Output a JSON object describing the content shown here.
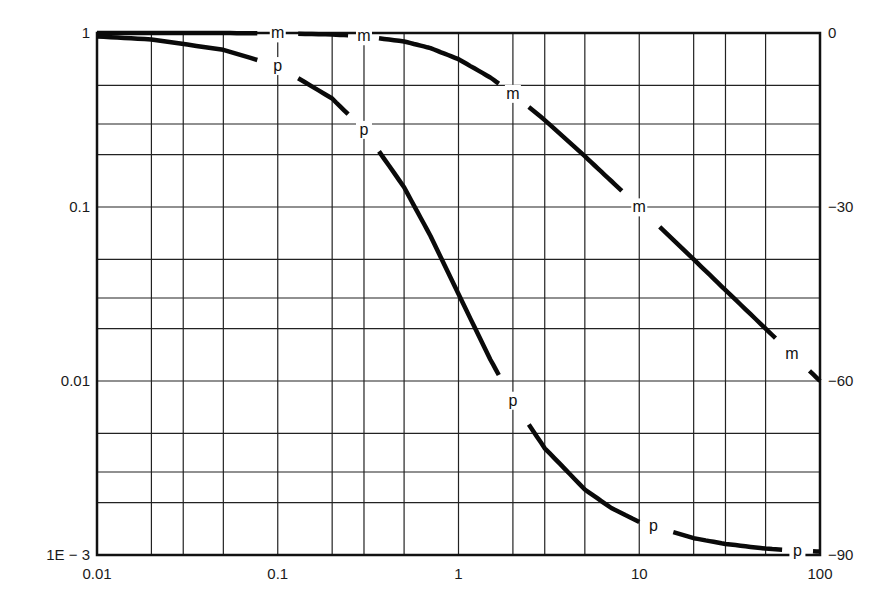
{
  "chart_data": {
    "type": "line",
    "title": "",
    "xlabel": "",
    "ylabel": "",
    "ylabel_right": "",
    "x_scale": "log",
    "y_scale": "log",
    "xlim": [
      0.01,
      100
    ],
    "ylim": [
      0.001,
      1
    ],
    "ylim_right": [
      -90,
      0
    ],
    "grid": true,
    "legend": null,
    "x_ticks": [
      {
        "value": 0.01,
        "label": "0.01"
      },
      {
        "value": 0.1,
        "label": "0.1"
      },
      {
        "value": 1,
        "label": "1"
      },
      {
        "value": 10,
        "label": "10"
      },
      {
        "value": 100,
        "label": "100"
      }
    ],
    "y_ticks_left": [
      {
        "value": 1,
        "label": "1"
      },
      {
        "value": 0.1,
        "label": "0.1"
      },
      {
        "value": 0.01,
        "label": "0.01"
      },
      {
        "value": 0.001,
        "label": "1E − 3"
      }
    ],
    "y_ticks_right": [
      {
        "value": 0,
        "label": "0"
      },
      {
        "value": -30,
        "label": "−30"
      },
      {
        "value": -60,
        "label": "−60"
      },
      {
        "value": -90,
        "label": "−90"
      }
    ],
    "x_grid": [
      0.01,
      0.02,
      0.03,
      0.05,
      0.1,
      0.2,
      0.3,
      0.5,
      1,
      2,
      3,
      5,
      10,
      20,
      30,
      50,
      100
    ],
    "y_grid": [
      1,
      0.5,
      0.3,
      0.2,
      0.1,
      0.05,
      0.03,
      0.02,
      0.01,
      0.005,
      0.003,
      0.002,
      0.001
    ],
    "series": [
      {
        "name": "m",
        "description": "magnitude (left axis)",
        "axis": "left",
        "x": [
          0.01,
          0.02,
          0.05,
          0.1,
          0.2,
          0.3,
          0.5,
          0.7,
          1,
          1.5,
          2,
          3,
          5,
          7,
          10,
          20,
          30,
          50,
          70,
          100
        ],
        "values": [
          1.0,
          1.0,
          0.999,
          0.995,
          0.981,
          0.958,
          0.894,
          0.819,
          0.707,
          0.555,
          0.447,
          0.316,
          0.196,
          0.141,
          0.0995,
          0.05,
          0.0333,
          0.02,
          0.0143,
          0.01
        ],
        "labels_at": [
          0.1,
          0.3,
          2,
          10,
          70
        ]
      },
      {
        "name": "p",
        "description": "phase in degrees (right axis)",
        "axis": "right",
        "x": [
          0.01,
          0.02,
          0.05,
          0.1,
          0.2,
          0.3,
          0.5,
          0.7,
          1,
          1.5,
          2,
          3,
          5,
          7,
          10,
          20,
          30,
          50,
          70,
          100
        ],
        "values": [
          -0.6,
          -1.1,
          -2.9,
          -5.7,
          -11.3,
          -16.7,
          -26.6,
          -35.0,
          -45.0,
          -56.3,
          -63.4,
          -71.6,
          -78.7,
          -81.9,
          -84.3,
          -87.1,
          -88.1,
          -88.9,
          -89.2,
          -89.4
        ],
        "labels_at": [
          0.1,
          0.3,
          2,
          12,
          75
        ]
      }
    ]
  }
}
